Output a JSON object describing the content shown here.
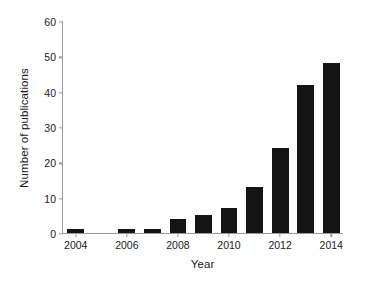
{
  "chart_data": {
    "type": "bar",
    "title": "",
    "subtitle": "",
    "xlabel": "Year",
    "ylabel": "Number of publications",
    "categories": [
      "2004",
      "2005",
      "2006",
      "2007",
      "2008",
      "2009",
      "2010",
      "2011",
      "2012",
      "2013",
      "2014"
    ],
    "values": [
      1,
      0,
      1,
      1,
      4,
      5,
      7,
      13,
      24,
      42,
      48
    ],
    "ylim": [
      0,
      60
    ],
    "yticks": [
      0,
      10,
      20,
      30,
      40,
      50,
      60
    ],
    "ytick_labels": [
      "0",
      "10",
      "20",
      "30",
      "40",
      "50",
      "60"
    ],
    "xticks": [
      "2004",
      "2006",
      "2008",
      "2010",
      "2012",
      "2014"
    ],
    "xtick_labels": [
      "2004",
      "2006",
      "2008",
      "2010",
      "2012",
      "2014"
    ],
    "grid": false,
    "legend": false,
    "legend_position": "none",
    "bar_color": "#141414",
    "axis_color": "#9a9a9a",
    "background_color": "#ffffff"
  }
}
